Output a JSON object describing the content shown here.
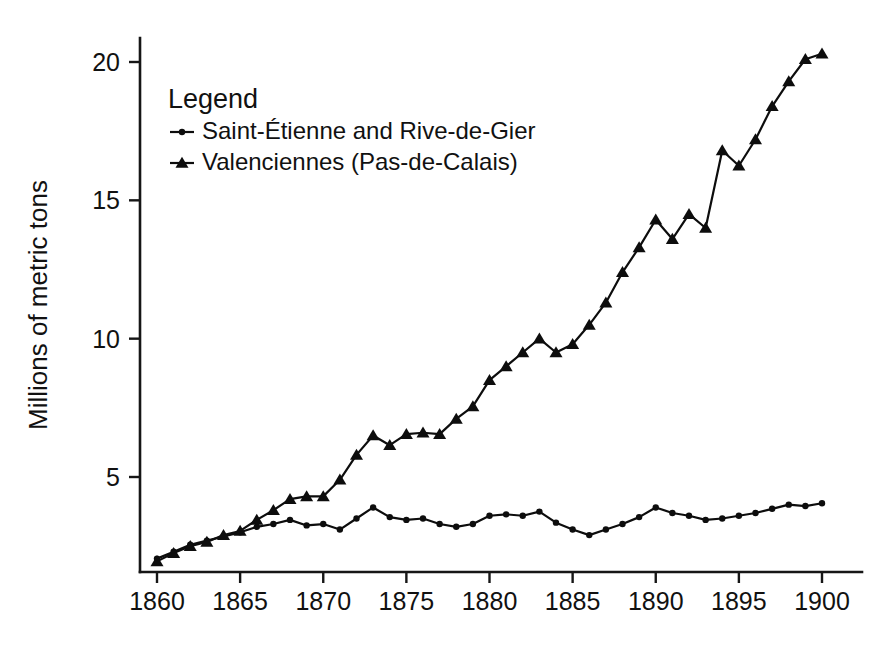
{
  "chart_data": {
    "type": "line",
    "title": "",
    "xlabel": "",
    "ylabel": "Millions of metric tons",
    "xlim": [
      1859.2,
      1900.8
    ],
    "ylim": [
      1.2,
      21.2
    ],
    "xticks": [
      1860,
      1865,
      1870,
      1875,
      1880,
      1885,
      1890,
      1895,
      1900
    ],
    "yticks": [
      5,
      10,
      15,
      20
    ],
    "grid": false,
    "legend_title": "Legend",
    "legend_position": "upper-left-inside",
    "x": [
      1860,
      1861,
      1862,
      1863,
      1864,
      1865,
      1866,
      1867,
      1868,
      1869,
      1870,
      1871,
      1872,
      1873,
      1874,
      1875,
      1876,
      1877,
      1878,
      1879,
      1880,
      1881,
      1882,
      1883,
      1884,
      1885,
      1886,
      1887,
      1888,
      1889,
      1890,
      1891,
      1892,
      1893,
      1894,
      1895,
      1896,
      1897,
      1898,
      1899,
      1900
    ],
    "series": [
      {
        "name": "Saint-Étienne and Rive-de-Gier",
        "marker": "dot",
        "values": [
          2.05,
          2.3,
          2.55,
          2.7,
          2.85,
          3.0,
          3.2,
          3.3,
          3.45,
          3.25,
          3.3,
          3.1,
          3.5,
          3.9,
          3.55,
          3.45,
          3.5,
          3.3,
          3.2,
          3.3,
          3.6,
          3.65,
          3.6,
          3.75,
          3.35,
          3.1,
          2.9,
          3.1,
          3.3,
          3.55,
          3.9,
          3.7,
          3.6,
          3.45,
          3.5,
          3.6,
          3.7,
          3.85,
          4.0,
          3.95,
          4.05
        ]
      },
      {
        "name": "Valenciennes (Pas-de-Calais)",
        "marker": "triangle",
        "values": [
          1.95,
          2.25,
          2.5,
          2.65,
          2.9,
          3.05,
          3.45,
          3.8,
          4.2,
          4.3,
          4.3,
          4.9,
          5.8,
          6.5,
          6.15,
          6.55,
          6.6,
          6.55,
          7.1,
          7.55,
          8.5,
          9.0,
          9.5,
          10.0,
          9.5,
          9.8,
          10.5,
          11.3,
          12.4,
          13.3,
          14.3,
          13.6,
          14.5,
          14.0,
          16.8,
          16.25,
          17.2,
          18.4,
          19.3,
          20.1,
          20.3
        ]
      }
    ]
  },
  "legend": {
    "title": "Legend",
    "items": [
      {
        "label": "Saint-Étienne and Rive-de-Gier",
        "marker": "dot"
      },
      {
        "label": "Valenciennes (Pas-de-Calais)",
        "marker": "triangle"
      }
    ]
  }
}
